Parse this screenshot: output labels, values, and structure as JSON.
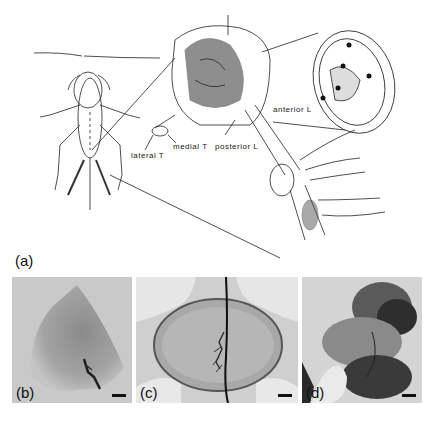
{
  "figure": {
    "panel_a": {
      "letter": "(a)",
      "labels": {
        "lateral_t": "lateral T",
        "medial_t": "medial T",
        "posterior_l": "posterior L",
        "anterior_l": "anterior L"
      }
    },
    "panels": [
      {
        "letter": "(b)"
      },
      {
        "letter": "(c)"
      },
      {
        "letter": "(d)"
      }
    ]
  }
}
